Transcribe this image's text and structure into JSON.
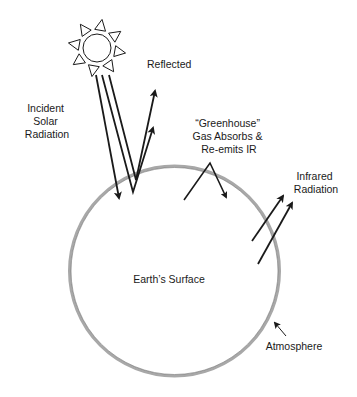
{
  "diagram": {
    "labels": {
      "incident": [
        "Incident",
        "Solar",
        "Radiation"
      ],
      "reflected": "Reflected",
      "greenhouse": [
        "“Greenhouse”",
        "Gas Absorbs &",
        "Re-emits IR"
      ],
      "infrared": [
        "Infrared",
        "Radiation"
      ],
      "earth": "Earth’s Surface",
      "atmosphere": "Atmosphere"
    },
    "icons": {
      "sun": "sun-icon"
    },
    "colors": {
      "ink": "#1a1a1a",
      "atmosphere": "#a8a8a8",
      "background": "#ffffff"
    }
  }
}
